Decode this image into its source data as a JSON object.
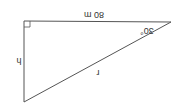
{
  "diagram": {
    "type": "right-triangle",
    "orientation": "rotated-180",
    "vertices": {
      "right_angle": [
        24,
        21
      ],
      "angle_vertex": [
        171,
        22
      ],
      "bottom": [
        24,
        102
      ]
    },
    "labels": {
      "top_side": "80 m",
      "angle": "30°",
      "left_side": "h",
      "hypotenuse": "r"
    },
    "colors": {
      "line": "#555555",
      "text": "#333333",
      "background": "#ffffff"
    }
  }
}
